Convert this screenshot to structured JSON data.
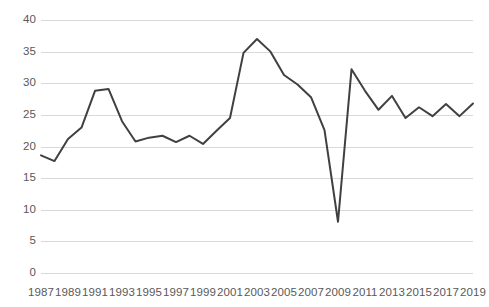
{
  "chart_data": {
    "type": "line",
    "title": "",
    "subtitle": "",
    "xlabel": "",
    "ylabel": "",
    "xlim": [
      1987,
      2019
    ],
    "ylim": [
      0,
      40
    ],
    "grid": true,
    "legend": false,
    "legend_position": "none",
    "y_ticks": [
      40,
      35,
      30,
      25,
      20,
      15,
      10,
      5,
      0
    ],
    "y_tick_labels": [
      "40",
      "35",
      "30",
      "25",
      "20",
      "15",
      "10",
      "5",
      "0"
    ],
    "x_ticks": [
      1987,
      1989,
      1991,
      1993,
      1995,
      1997,
      1999,
      2001,
      2003,
      2005,
      2007,
      2009,
      2011,
      2013,
      2015,
      2017,
      2019
    ],
    "x_tick_labels": [
      "1987",
      "1989",
      "1991",
      "1993",
      "1995",
      "1997",
      "1999",
      "2001",
      "2003",
      "2005",
      "2007",
      "2009",
      "2011",
      "2013",
      "2015",
      "2017",
      "2019"
    ],
    "x": [
      1987,
      1988,
      1989,
      1990,
      1991,
      1992,
      1993,
      1994,
      1995,
      1996,
      1997,
      1998,
      1999,
      2000,
      2001,
      2002,
      2003,
      2004,
      2005,
      2006,
      2007,
      2008,
      2009,
      2010,
      2011,
      2012,
      2013,
      2014,
      2015,
      2016,
      2017,
      2018,
      2019
    ],
    "series": [
      {
        "name": "series-1",
        "color": "#404040",
        "line_width": 2,
        "markers": false,
        "values": [
          18.6,
          17.7,
          21.2,
          23.0,
          28.8,
          29.1,
          24.0,
          20.8,
          21.4,
          21.7,
          20.7,
          21.7,
          20.4,
          22.5,
          24.5,
          34.8,
          37.0,
          35.0,
          31.3,
          29.8,
          27.8,
          22.6,
          8.1,
          32.2,
          28.8,
          25.8,
          28.0,
          24.5,
          26.2,
          24.8,
          26.7,
          24.8,
          26.8
        ]
      }
    ]
  },
  "colors": {
    "line": "#404040",
    "gridline": "#d9d9d9",
    "tick_label": "#595959",
    "background": "#ffffff"
  }
}
